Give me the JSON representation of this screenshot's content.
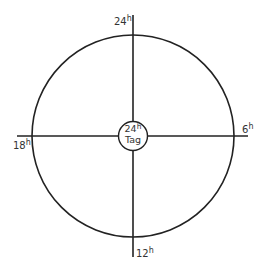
{
  "diagram": {
    "center": {
      "hours_value": "24",
      "hours_unit": "h",
      "label": "Tag"
    },
    "labels": {
      "top": {
        "value": "24",
        "unit": "h"
      },
      "right": {
        "value": "6",
        "unit": "h"
      },
      "bottom": {
        "value": "12",
        "unit": "h"
      },
      "left": {
        "value": "18",
        "unit": "h"
      }
    },
    "colors": {
      "stroke": "#222222",
      "text": "#333333",
      "background": "#ffffff"
    }
  }
}
